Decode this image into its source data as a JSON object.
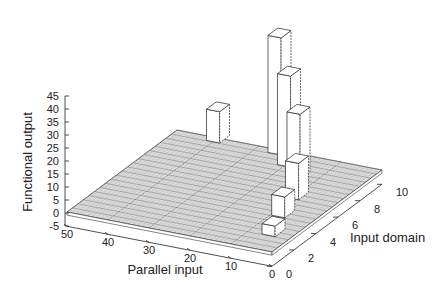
{
  "chart_data": {
    "type": "bar3d",
    "title": "",
    "xlabel": "Parallel input",
    "ylabel": "Input domain",
    "zlabel": "Functional output",
    "x_ticks": [
      "0",
      "10",
      "20",
      "30",
      "40",
      "50"
    ],
    "y_ticks": [
      "0",
      "2",
      "4",
      "6",
      "8",
      "10"
    ],
    "z_ticks": [
      "-5",
      "0",
      "5",
      "10",
      "15",
      "20",
      "25",
      "30",
      "35",
      "40",
      "45"
    ],
    "xlim": [
      0,
      50
    ],
    "ylim": [
      0,
      10
    ],
    "zlim": [
      -5,
      45
    ],
    "floor_value": 0,
    "bars": [
      {
        "parallel_input": 40,
        "input_domain": 10,
        "value": 12
      },
      {
        "parallel_input": 25,
        "input_domain": 10,
        "value": 45
      },
      {
        "parallel_input": 20,
        "input_domain": 9,
        "value": 35
      },
      {
        "parallel_input": 15,
        "input_domain": 8,
        "value": 25
      },
      {
        "parallel_input": 10,
        "input_domain": 6,
        "value": 14
      },
      {
        "parallel_input": 8,
        "input_domain": 4,
        "value": 8
      },
      {
        "parallel_input": 5,
        "input_domain": 2,
        "value": 4
      }
    ],
    "grid": true,
    "legend": null
  }
}
